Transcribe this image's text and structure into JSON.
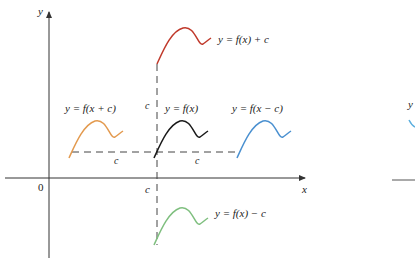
{
  "figure": {
    "axes": {
      "x_label": "x",
      "y_label": "y",
      "origin_label": "0",
      "x_tick_label": "c"
    },
    "curves": [
      {
        "id": "base",
        "label": "y = f(x)",
        "color": "#1a1a1a",
        "shift": "none"
      },
      {
        "id": "up",
        "label": "y = f(x) + c",
        "color": "#c0392b",
        "shift": "up by c"
      },
      {
        "id": "down",
        "label": "y = f(x) − c",
        "color": "#7fbf7f",
        "shift": "down by c"
      },
      {
        "id": "left",
        "label": "y = f(x + c)",
        "color": "#e39a4f",
        "shift": "left by c"
      },
      {
        "id": "right",
        "label": "y = f(x − c)",
        "color": "#4a90d0",
        "shift": "right by c"
      }
    ],
    "dimension_labels": {
      "vertical_up": "c",
      "vertical_axis": "c",
      "horizontal_left": "c",
      "horizontal_right": "c"
    },
    "partial_second_figure": {
      "y_label": "y",
      "color": "#5aaede"
    },
    "colors": {
      "axis": "#333333",
      "dashed": "#444444",
      "text": "#222222"
    }
  }
}
